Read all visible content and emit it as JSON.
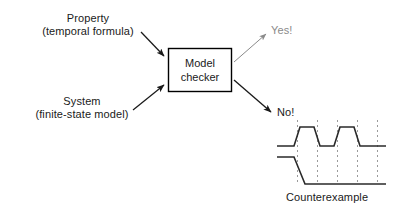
{
  "diagram": {
    "background_color": "#ffffff",
    "inputs": [
      {
        "id": "property",
        "line1": "Property",
        "line2": "(temporal formula)",
        "text": "Property\n(temporal formula)"
      },
      {
        "id": "system",
        "line1": "System",
        "line2": "(finite-state model)",
        "text": "System\n(finite-state model)"
      }
    ],
    "process_box": {
      "line1": "Model",
      "line2": "checker",
      "border_color": "#000000",
      "fill_color": "#ffffff"
    },
    "outputs": [
      {
        "id": "yes",
        "label": "Yes!",
        "color": "#8a8a8a",
        "arrow_color": "#8a8a8a"
      },
      {
        "id": "no",
        "label": "No!",
        "color": "#1a1a1a",
        "arrow_color": "#1a1a1a"
      }
    ],
    "counterexample": {
      "caption": "Counterexample",
      "trace_color": "#2a2a2a",
      "gridline_color": "#9a9a9a",
      "gridline_count": 5,
      "signals": [
        {
          "name": "signal-top",
          "initial_level": "low",
          "pulses": 2
        },
        {
          "name": "signal-bottom",
          "initial_level": "high",
          "pulses": 0
        }
      ]
    }
  },
  "icons": {
    "arrow_head": "arrowhead-triangle"
  }
}
